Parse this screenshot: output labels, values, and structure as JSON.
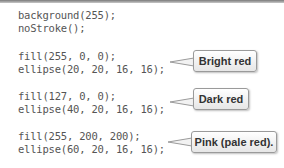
{
  "code": {
    "lines": [
      "background(255);",
      "noStroke();",
      "fill(255, 0, 0);",
      "ellipse(20, 20, 16, 16);",
      "fill(127, 0, 0);",
      "ellipse(40, 20, 16, 16);",
      "fill(255, 200, 200);",
      "ellipse(60, 20, 16, 16);"
    ]
  },
  "callouts": [
    {
      "label": "Bright red"
    },
    {
      "label": "Dark red"
    },
    {
      "label": "Pink (pale red)."
    }
  ]
}
